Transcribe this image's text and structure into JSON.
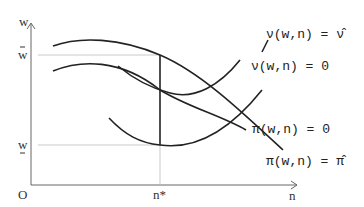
{
  "diagram": {
    "axes": {
      "y_label": "w",
      "x_label": "n",
      "origin_label": "O",
      "y_ticks": [
        {
          "label": "w̄",
          "position": "upper"
        },
        {
          "label": "w̲",
          "position": "lower"
        }
      ],
      "x_ticks": [
        {
          "label": "n*"
        }
      ]
    },
    "curves": [
      {
        "id": "nu-hat",
        "label": "ν(w,n) = ν̂",
        "shape": "U"
      },
      {
        "id": "nu-zero",
        "label": "ν(w,n) = 0",
        "shape": "U"
      },
      {
        "id": "pi-zero",
        "label": "π(w,n) = 0",
        "shape": "hump"
      },
      {
        "id": "pi-hat",
        "label": "π(w,n) = π̂",
        "shape": "hump"
      }
    ],
    "labels": {
      "nu_hat": "ν(w,n) = ν̂",
      "nu_zero": "ν(w,n) = 0",
      "pi_zero": "π(w,n) = 0",
      "pi_hat": "π(w,n) = π̂",
      "y_axis": "w",
      "x_axis": "n",
      "origin": "O",
      "w_bar": "w",
      "w_under": "w",
      "n_star": "n*"
    }
  }
}
